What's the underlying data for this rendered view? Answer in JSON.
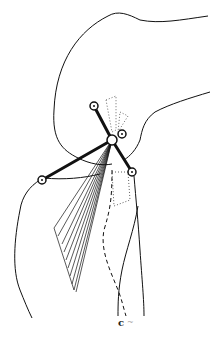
{
  "figure": {
    "label": "c",
    "line_color": "#111111",
    "background": "#ffffff"
  }
}
